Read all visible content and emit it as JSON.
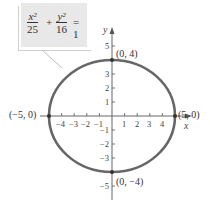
{
  "equation": {
    "term1": {
      "numerator": "x²",
      "denominator": "25"
    },
    "plus": "+",
    "term2": {
      "numerator": "y²",
      "denominator": "16"
    },
    "equals": "= 1"
  },
  "axes": {
    "x_label": "x",
    "y_label": "y",
    "x_ticks": [
      "−4",
      "−3",
      "−2",
      "−1",
      "1",
      "2",
      "3",
      "4"
    ],
    "y_ticks": [
      "5",
      "3",
      "2",
      "1",
      "−1",
      "−2",
      "−3",
      "−5"
    ]
  },
  "points": [
    {
      "label": "(0, 4)",
      "x": 0,
      "y": 4
    },
    {
      "label": "(0, −4)",
      "x": 0,
      "y": -4
    },
    {
      "label": "(−5, 0)",
      "x": -5,
      "y": 0
    },
    {
      "label": "(5, 0)",
      "x": 5,
      "y": 0
    }
  ],
  "ellipse": {
    "a": 5,
    "b": 4,
    "color": "#666666"
  },
  "colors": {
    "curve": "#666666",
    "axis": "#555555",
    "callout_bg": "#e8e8e8"
  }
}
